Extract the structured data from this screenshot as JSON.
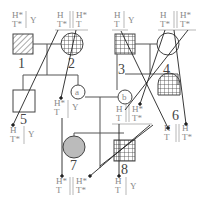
{
  "individuals": {
    "i1": {
      "label": "1",
      "geno_top": [
        "H*",
        "Y"
      ],
      "geno_bot": [
        "T*",
        ""
      ]
    },
    "i2": {
      "label": "2",
      "geno_top": [
        "H",
        "H*"
      ],
      "geno_bot": [
        "T*",
        "T"
      ]
    },
    "i3": {
      "label": "3",
      "geno_top": [
        "H",
        "Y"
      ],
      "geno_bot": [
        "T",
        ""
      ]
    },
    "i4": {
      "label": "4",
      "geno_top": [
        "H",
        "H*"
      ],
      "geno_bot": [
        "T*",
        "T*"
      ]
    },
    "i5": {
      "label": "5",
      "geno_top": [
        "H",
        "Y"
      ],
      "geno_bot": [
        "T*",
        ""
      ]
    },
    "a": {
      "label": "a",
      "geno_top": [
        "H*",
        "Y"
      ],
      "geno_bot": [
        "T",
        ""
      ]
    },
    "b": {
      "label": "b",
      "geno_top": [
        "H",
        "H*"
      ],
      "geno_bot": [
        "T",
        "T*"
      ]
    },
    "i6": {
      "label": "6",
      "geno_top": [
        "H",
        "H"
      ],
      "geno_bot": [
        "T",
        "T*"
      ]
    },
    "i7": {
      "label": "7",
      "geno_top": [
        "H*",
        "H*"
      ],
      "geno_bot": [
        "T",
        "T*"
      ]
    },
    "i8": {
      "label": "8",
      "geno_top": [
        "H",
        "Y"
      ],
      "geno_bot": [
        "T",
        ""
      ]
    }
  }
}
